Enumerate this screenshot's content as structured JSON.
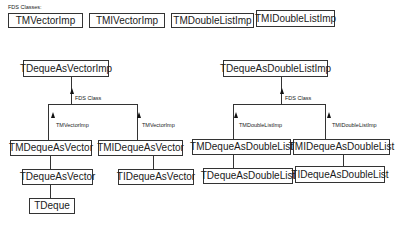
{
  "header": {
    "caption": "FDS Classes:"
  },
  "fds_classes": [
    "TMVectorImp",
    "TMIVectorImp",
    "TMDoubleListImp",
    "TMIDoubleListImp"
  ],
  "vector_tree": {
    "root": "TDequeAsVectorImp",
    "root_link_label": "FDS Class",
    "left": {
      "name": "TMDequeAsVector",
      "link_label": "TMVectorImp",
      "child": "TDequeAsVector",
      "grandchild": "TDeque"
    },
    "right": {
      "name": "TMIDequeAsVector",
      "link_label": "TMVectorImp",
      "child": "TIDequeAsVector"
    }
  },
  "list_tree": {
    "root": "TDequeAsDoubleListImp",
    "root_link_label": "FDS Class",
    "left": {
      "name": "TMDequeAsDoubleList",
      "link_label": "TMDoubleListImp",
      "child": "TDequeAsDoubleList"
    },
    "right": {
      "name": "TMIDequeAsDoubleList",
      "link_label": "TMIDoubleListImp",
      "child": "TIDequeAsDoubleList"
    }
  }
}
